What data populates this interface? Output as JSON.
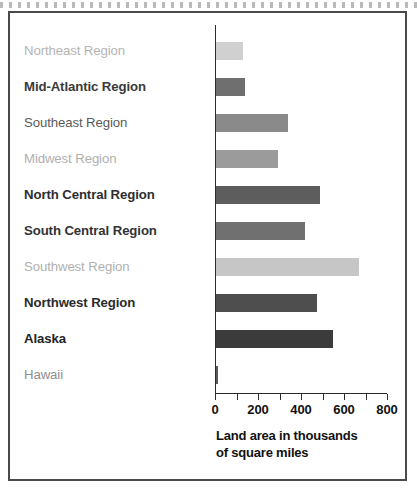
{
  "chart_data": {
    "type": "bar",
    "orientation": "horizontal",
    "title": "",
    "xlabel": "Land area in thousands of square miles",
    "ylabel": "",
    "xlim": [
      0,
      800
    ],
    "xticks": [
      0,
      200,
      400,
      600,
      800
    ],
    "xtick_labels": [
      "0",
      "200",
      "400",
      "600",
      "800"
    ],
    "minor_tick_step": 100,
    "grid": false,
    "legend": "none",
    "categories": [
      "Northeast Region",
      "Mid-Atlantic Region",
      "Southeast Region",
      "Midwest Region",
      "North Central Region",
      "South Central Region",
      "Southwest Region",
      "Northwest Region",
      "Alaska",
      "Hawaii"
    ],
    "values": [
      127,
      135,
      337,
      288,
      483,
      415,
      663,
      468,
      546,
      10
    ],
    "bars": [
      {
        "label": "Northeast Region",
        "value": 127,
        "color": "#d0d0d0",
        "label_color": "#b4b4b4",
        "bold": false
      },
      {
        "label": "Mid-Atlantic Region",
        "value": 135,
        "color": "#6f6f6f",
        "label_color": "#3a3a3a",
        "bold": true
      },
      {
        "label": "Southeast Region",
        "value": 337,
        "color": "#8a8a8a",
        "label_color": "#5a5a5a",
        "bold": false
      },
      {
        "label": "Midwest Region",
        "value": 288,
        "color": "#9b9b9b",
        "label_color": "#b0b0b0",
        "bold": false
      },
      {
        "label": "North Central Region",
        "value": 483,
        "color": "#5d5d5d",
        "label_color": "#2e2e2e",
        "bold": true
      },
      {
        "label": "South Central Region",
        "value": 415,
        "color": "#707070",
        "label_color": "#333333",
        "bold": true
      },
      {
        "label": "Southwest Region",
        "value": 663,
        "color": "#c6c6c6",
        "label_color": "#b0b0b0",
        "bold": false
      },
      {
        "label": "Northwest Region",
        "value": 468,
        "color": "#4e4e4e",
        "label_color": "#2b2b2b",
        "bold": true
      },
      {
        "label": "Alaska",
        "value": 546,
        "color": "#3b3b3b",
        "label_color": "#222222",
        "bold": true
      },
      {
        "label": "Hawaii",
        "value": 10,
        "color": "#5a5a5a",
        "label_color": "#8d8d8d",
        "bold": false
      }
    ]
  },
  "axis": {
    "title_line1": "Land area in thousands",
    "title_line2": "of square miles"
  },
  "colors": {
    "frame": "#4a4a4a",
    "axis": "#2c2c2c",
    "background": "#ffffff"
  }
}
